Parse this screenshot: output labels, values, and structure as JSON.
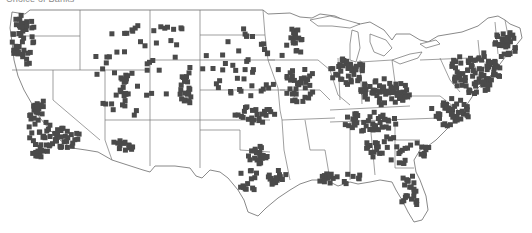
{
  "caption": "Choice of Banks",
  "map": {
    "region": "Contiguous United States",
    "marker_shape": "square",
    "marker_size": 5,
    "colors": {
      "marker": "#4a4a4a",
      "border": "#6b6b6b",
      "background": "#ffffff"
    },
    "clusters": [
      {
        "name": "pacific-northwest",
        "cx": 24,
        "cy": 40,
        "rx": 12,
        "ry": 28,
        "count": 45
      },
      {
        "name": "california-central",
        "cx": 40,
        "cy": 130,
        "rx": 12,
        "ry": 30,
        "count": 50
      },
      {
        "name": "southern-california",
        "cx": 65,
        "cy": 138,
        "rx": 16,
        "ry": 10,
        "count": 30
      },
      {
        "name": "utah-wasatch",
        "cx": 125,
        "cy": 90,
        "rx": 6,
        "ry": 18,
        "count": 18
      },
      {
        "name": "colorado-front-range",
        "cx": 185,
        "cy": 92,
        "rx": 6,
        "ry": 18,
        "count": 16
      },
      {
        "name": "arizona",
        "cx": 122,
        "cy": 148,
        "rx": 12,
        "ry": 8,
        "count": 14
      },
      {
        "name": "texas-dfw",
        "cx": 258,
        "cy": 155,
        "rx": 10,
        "ry": 10,
        "count": 22
      },
      {
        "name": "texas-houston",
        "cx": 278,
        "cy": 178,
        "rx": 10,
        "ry": 8,
        "count": 16
      },
      {
        "name": "texas-central",
        "cx": 248,
        "cy": 180,
        "rx": 10,
        "ry": 14,
        "count": 14
      },
      {
        "name": "minnesota",
        "cx": 295,
        "cy": 42,
        "rx": 10,
        "ry": 14,
        "count": 18
      },
      {
        "name": "iowa-missouri",
        "cx": 300,
        "cy": 85,
        "rx": 16,
        "ry": 18,
        "count": 35
      },
      {
        "name": "kansas-oklahoma",
        "cx": 255,
        "cy": 115,
        "rx": 20,
        "ry": 10,
        "count": 24
      },
      {
        "name": "chicago-great-lakes",
        "cx": 348,
        "cy": 72,
        "rx": 18,
        "ry": 14,
        "count": 40
      },
      {
        "name": "ohio-valley",
        "cx": 385,
        "cy": 92,
        "rx": 26,
        "ry": 14,
        "count": 60
      },
      {
        "name": "tennessee-kentucky",
        "cx": 370,
        "cy": 122,
        "rx": 30,
        "ry": 10,
        "count": 40
      },
      {
        "name": "southeast",
        "cx": 395,
        "cy": 150,
        "rx": 35,
        "ry": 14,
        "count": 40
      },
      {
        "name": "gulf-coast",
        "cx": 340,
        "cy": 178,
        "rx": 25,
        "ry": 6,
        "count": 20
      },
      {
        "name": "northeast-corridor",
        "cx": 475,
        "cy": 72,
        "rx": 26,
        "ry": 22,
        "count": 90
      },
      {
        "name": "new-england",
        "cx": 505,
        "cy": 45,
        "rx": 12,
        "ry": 14,
        "count": 30
      },
      {
        "name": "mid-atlantic",
        "cx": 450,
        "cy": 112,
        "rx": 20,
        "ry": 14,
        "count": 40
      },
      {
        "name": "florida",
        "cx": 410,
        "cy": 192,
        "rx": 10,
        "ry": 20,
        "count": 22
      },
      {
        "name": "scattered-west",
        "cx": 150,
        "cy": 70,
        "rx": 70,
        "ry": 50,
        "count": 55
      },
      {
        "name": "scattered-plains",
        "cx": 245,
        "cy": 60,
        "rx": 40,
        "ry": 40,
        "count": 40
      }
    ]
  }
}
